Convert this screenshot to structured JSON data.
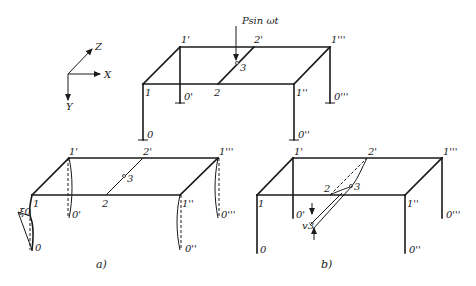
{
  "axes": {
    "x": "X",
    "y": "Y",
    "z": "Z"
  },
  "load": {
    "label": "Psin ωt"
  },
  "top_frame": {
    "nodes": {
      "n1": "1",
      "n1p": "1'",
      "n1pp": "1''",
      "n1ppp": "1'''",
      "n0": "0",
      "n0p": "0'",
      "n0pp": "0''",
      "n0ppp": "0'''",
      "n2": "2",
      "n2p": "2'",
      "n3": "3"
    }
  },
  "frame_a": {
    "caption": "a)",
    "displacement_label": "ξ0",
    "nodes": {
      "n1": "1",
      "n1p": "1'",
      "n1pp": "1''",
      "n1ppp": "1'''",
      "n0": "0",
      "n0p": "0'",
      "n0pp": "0''",
      "n0ppp": "0'''",
      "n2": "2",
      "n2p": "2'",
      "n3": "3"
    }
  },
  "frame_b": {
    "caption": "b)",
    "displacement_label": "v3",
    "nodes": {
      "n1": "1",
      "n1p": "1'",
      "n1pp": "1''",
      "n1ppp": "1'''",
      "n0": "0",
      "n0p": "0'",
      "n0pp": "0''",
      "n0ppp": "0'''",
      "n2": "2",
      "n2p": "2'",
      "n3": "3"
    }
  }
}
